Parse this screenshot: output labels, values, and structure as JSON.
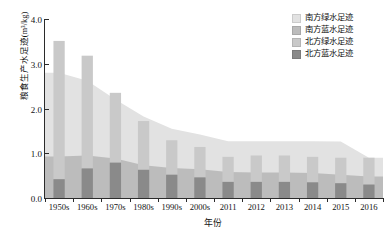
{
  "chart_data": {
    "type": "area",
    "title": "",
    "xlabel": "年份",
    "ylabel": "粮食生产水足迹(m³/kg)",
    "categories": [
      "1950s",
      "1960s",
      "1970s",
      "1980s",
      "1990s",
      "2000s",
      "2011",
      "2012",
      "2013",
      "2014",
      "2015",
      "2016"
    ],
    "ylim": [
      0,
      4.0
    ],
    "yticks": [
      "0.0",
      "1.0",
      "2.0",
      "3.0",
      "4.0"
    ],
    "ytick_values": [
      0,
      1,
      2,
      3,
      4
    ],
    "grid": false,
    "legend_position": "top-right",
    "series": [
      {
        "name": "南方绿水足迹",
        "render": "area-stacked-background",
        "color": "#e2e2e2",
        "values": [
          1.87,
          1.67,
          1.32,
          1.09,
          0.88,
          0.78,
          0.69,
          0.7,
          0.7,
          0.71,
          0.74,
          0.42
        ]
      },
      {
        "name": "南方蓝水足迹",
        "render": "area-stacked-background",
        "color": "#bcbcbc",
        "values": [
          0.93,
          0.95,
          0.88,
          0.73,
          0.67,
          0.64,
          0.58,
          0.57,
          0.57,
          0.56,
          0.52,
          0.48
        ]
      },
      {
        "name": "北方绿水足迹",
        "render": "bar-stacked-foreground",
        "color": "#c9c9c9",
        "values": [
          3.09,
          2.52,
          1.56,
          1.09,
          0.77,
          0.68,
          0.56,
          0.59,
          0.59,
          0.57,
          0.57,
          0.6
        ]
      },
      {
        "name": "北方蓝水足迹",
        "render": "bar-stacked-foreground",
        "color": "#8a8a8a",
        "values": [
          0.42,
          0.66,
          0.79,
          0.63,
          0.52,
          0.46,
          0.36,
          0.36,
          0.36,
          0.35,
          0.33,
          0.3
        ]
      }
    ],
    "series_totals": {
      "south_total": [
        2.8,
        2.62,
        2.2,
        1.82,
        1.55,
        1.42,
        1.27,
        1.27,
        1.27,
        1.27,
        1.26,
        0.9
      ],
      "north_total": [
        3.51,
        3.18,
        2.35,
        1.72,
        1.29,
        1.14,
        0.92,
        0.95,
        0.95,
        0.92,
        0.9,
        0.9
      ]
    }
  },
  "legend": {
    "items": [
      {
        "label": "南方绿水足迹",
        "color": "#e2e2e2"
      },
      {
        "label": "南方蓝水足迹",
        "color": "#bcbcbc"
      },
      {
        "label": "北方绿水足迹",
        "color": "#c9c9c9"
      },
      {
        "label": "北方蓝水足迹",
        "color": "#8a8a8a"
      }
    ]
  },
  "axes": {
    "y_title": "粮食生产水足迹(m³/kg)",
    "x_title": "年份"
  }
}
